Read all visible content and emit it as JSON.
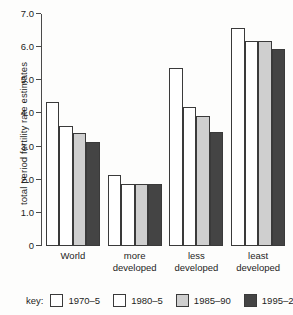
{
  "chart_data": {
    "type": "bar",
    "title": "",
    "subtitle": "",
    "xlabel": "",
    "ylabel": "total period fertility rate estimates",
    "ylim": [
      0,
      7.0
    ],
    "ytick_labels": [
      "7.0",
      "6.0",
      "5.0",
      "4.0",
      "3.0",
      "2.0",
      "1.0",
      "0"
    ],
    "ytick_values": [
      7.0,
      6.0,
      5.0,
      4.0,
      3.0,
      2.0,
      1.0,
      0
    ],
    "grid": false,
    "legend_position": "bottom",
    "legend_title": "key:",
    "categories": [
      "World",
      "more developed",
      "less developed",
      "least developed"
    ],
    "category_lines": [
      [
        "World"
      ],
      [
        "more",
        "developed"
      ],
      [
        "less",
        "developed"
      ],
      [
        "least",
        "developed"
      ]
    ],
    "series": [
      {
        "name": "1970–5",
        "color": "#ffffff",
        "values": [
          4.35,
          2.15,
          5.38,
          6.57
        ]
      },
      {
        "name": "1980–5",
        "color": "#ffffff",
        "values": [
          3.62,
          1.88,
          4.18,
          6.2
        ]
      },
      {
        "name": "1985–90",
        "color": "#cfcfcf",
        "values": [
          3.42,
          1.88,
          3.92,
          6.2
        ]
      },
      {
        "name": "1995–2000",
        "color": "#444444",
        "values": [
          3.15,
          1.88,
          3.43,
          5.95
        ]
      }
    ]
  },
  "colors": {
    "axis": "#4a4a4a",
    "bar_outline": "#3a3a3a",
    "background": "#fdfdfc",
    "text": "#1d1d1d"
  }
}
